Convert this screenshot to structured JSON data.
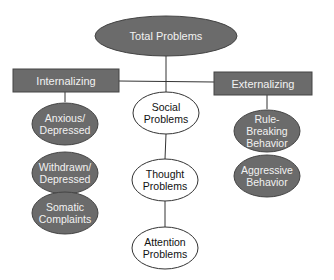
{
  "diagram": {
    "colors": {
      "dark_fill": "#6b6b6b",
      "dark_stroke": "#444444",
      "light_fill": "#ffffff",
      "light_stroke": "#333333",
      "line": "#333333"
    },
    "root": {
      "label": "Total Problems"
    },
    "branches": {
      "internalizing": {
        "label": "Internalizing",
        "children": [
          {
            "line1": "Anxious/",
            "line2": "Depressed"
          },
          {
            "line1": "Withdrawn/",
            "line2": "Depressed"
          },
          {
            "line1": "Somatic",
            "line2": "Complaints"
          }
        ]
      },
      "center": {
        "children": [
          {
            "line1": "Social",
            "line2": "Problems"
          },
          {
            "line1": "Thought",
            "line2": "Problems"
          },
          {
            "line1": "Attention",
            "line2": "Problems"
          }
        ]
      },
      "externalizing": {
        "label": "Externalizing",
        "children": [
          {
            "line1": "Rule-Breaking",
            "line2": "Behavior"
          },
          {
            "line1": "Aggressive",
            "line2": "Behavior"
          }
        ]
      }
    }
  }
}
